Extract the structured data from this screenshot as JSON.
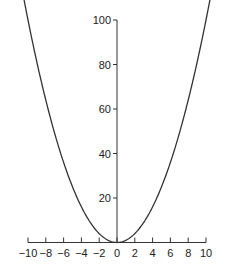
{
  "chart_data": {
    "type": "line",
    "title": "",
    "xlabel": "",
    "ylabel": "",
    "function": "y = x^2",
    "xlim": [
      -10,
      10
    ],
    "ylim": [
      0,
      100
    ],
    "grid": false,
    "legend": null,
    "x_ticks": [
      -10,
      -8,
      -6,
      -4,
      -2,
      0,
      2,
      4,
      6,
      8,
      10
    ],
    "x_tick_labels": [
      "−10",
      "−8",
      "−6",
      "−4",
      "−2",
      "0",
      "2",
      "4",
      "6",
      "8",
      "10"
    ],
    "y_ticks": [
      20,
      40,
      60,
      80,
      100
    ],
    "y_tick_labels": [
      "20",
      "40",
      "60",
      "80",
      "100"
    ],
    "series": [
      {
        "name": "y = x^2",
        "x": [
          -10,
          -8,
          -6,
          -4,
          -2,
          0,
          2,
          4,
          6,
          8,
          10
        ],
        "y": [
          100,
          64,
          36,
          16,
          4,
          0,
          4,
          16,
          36,
          64,
          100
        ]
      }
    ],
    "colors": {
      "line": "#333333",
      "axis": "#333333"
    }
  }
}
